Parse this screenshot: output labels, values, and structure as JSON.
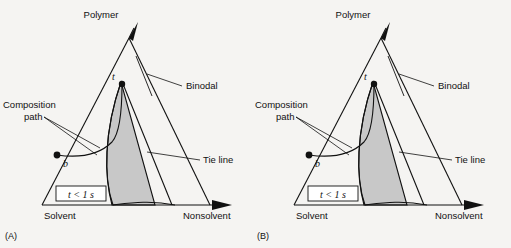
{
  "figure": {
    "type": "ternary-phase-diagram-pair",
    "background_color": "#f5f4f2",
    "line_color": "#111111",
    "shaded_region_color": "#c8c8c8"
  },
  "panels": [
    {
      "letter": "(A)",
      "axes": {
        "top": "Polymer",
        "bottom_left": "Solvent",
        "bottom_right": "Nonsolvent"
      },
      "annotations": {
        "binodal": "Binodal",
        "tie_line": "Tie line",
        "composition_path_line1": "Composition",
        "composition_path_line2": "path",
        "point_start": "b",
        "point_end": "t",
        "time_box": "t < 1 s"
      }
    },
    {
      "letter": "(B)",
      "axes": {
        "top": "Polymer",
        "bottom_left": "Solvent",
        "bottom_right": "Nonsolvent"
      },
      "annotations": {
        "binodal": "Binodal",
        "tie_line": "Tie line",
        "composition_path_line1": "Composition",
        "composition_path_line2": "path",
        "point_start": "b",
        "point_end": "t",
        "time_box": "t < 1 s"
      }
    }
  ]
}
